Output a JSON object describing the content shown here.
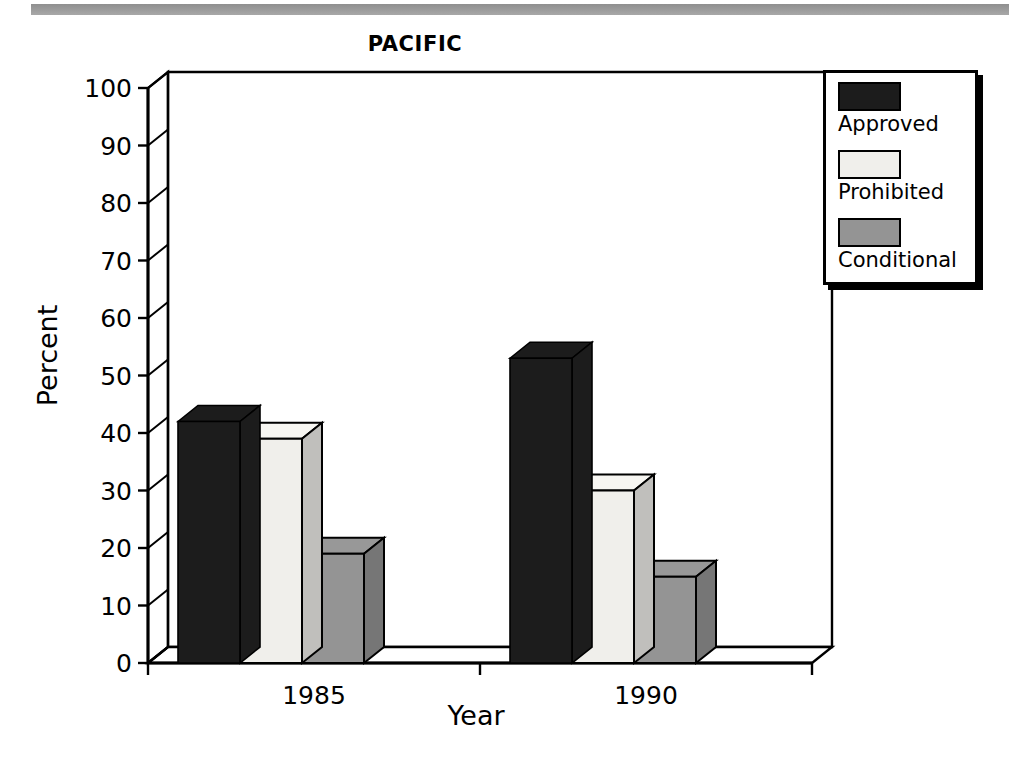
{
  "chart_data": {
    "type": "bar",
    "title": "PACIFIC",
    "xlabel": "Year",
    "ylabel": "Percent",
    "categories": [
      "1985",
      "1990"
    ],
    "series": [
      {
        "name": "Approved",
        "values": [
          42,
          53
        ],
        "color": "#1c1c1c"
      },
      {
        "name": "Prohibited",
        "values": [
          39,
          30
        ],
        "color": "#f0efeb"
      },
      {
        "name": "Conditional",
        "values": [
          19,
          15
        ],
        "color": "#949494"
      }
    ],
    "ylim": [
      0,
      100
    ],
    "yticks": [
      100,
      90,
      80,
      70,
      60,
      50,
      40,
      30,
      20,
      10,
      0
    ],
    "ytick_labels": [
      "100",
      "90",
      "80",
      "70",
      "60",
      "50",
      "40",
      "30",
      "20",
      "10",
      "0"
    ],
    "grid": "horizontal-dotted",
    "legend_position": "right-outside",
    "style": "3d-bars"
  },
  "legend": {
    "items": [
      {
        "label": "Approved",
        "color": "#1c1c1c"
      },
      {
        "label": "Prohibited",
        "color": "#f0efeb"
      },
      {
        "label": "Conditional",
        "color": "#949494"
      }
    ]
  }
}
